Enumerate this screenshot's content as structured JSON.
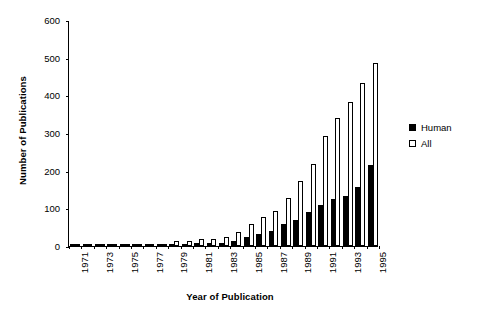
{
  "chart_data": {
    "type": "bar",
    "title": "",
    "xlabel": "Year of Publication",
    "ylabel": "Number of Publications",
    "ylim": [
      0,
      600
    ],
    "ytick_values": [
      0,
      100,
      200,
      300,
      400,
      500,
      600
    ],
    "ytick_labels": [
      "0",
      "100",
      "200",
      "300",
      "400",
      "500",
      "600"
    ],
    "grid": false,
    "legend_position": "right",
    "categories": [
      "1971",
      "1972",
      "1973",
      "1974",
      "1975",
      "1976",
      "1977",
      "1978",
      "1979",
      "1980",
      "1981",
      "1982",
      "1983",
      "1984",
      "1985",
      "1986",
      "1987",
      "1988",
      "1989",
      "1990",
      "1991",
      "1992",
      "1993",
      "1994",
      "1995"
    ],
    "xtick_labels": [
      "1971",
      "1973",
      "1975",
      "1977",
      "1979",
      "1981",
      "1983",
      "1985",
      "1987",
      "1989",
      "1991",
      "1993",
      "1995"
    ],
    "series": [
      {
        "name": "Human",
        "color": "#000000",
        "fill": "solid",
        "values": [
          1,
          1,
          2,
          2,
          3,
          3,
          3,
          3,
          5,
          6,
          7,
          7,
          9,
          14,
          25,
          33,
          41,
          59,
          69,
          90,
          108,
          124,
          134,
          158,
          215
        ]
      },
      {
        "name": "All",
        "color": "#ffffff",
        "fill": "open",
        "values": [
          2,
          3,
          4,
          5,
          5,
          5,
          5,
          6,
          12,
          13,
          18,
          19,
          25,
          37,
          59,
          76,
          92,
          128,
          172,
          218,
          292,
          341,
          383,
          434,
          487
        ]
      }
    ]
  },
  "legend": {
    "items": [
      {
        "label": "Human",
        "swatch": "filled-square-icon"
      },
      {
        "label": "All",
        "swatch": "open-square-icon"
      }
    ]
  }
}
